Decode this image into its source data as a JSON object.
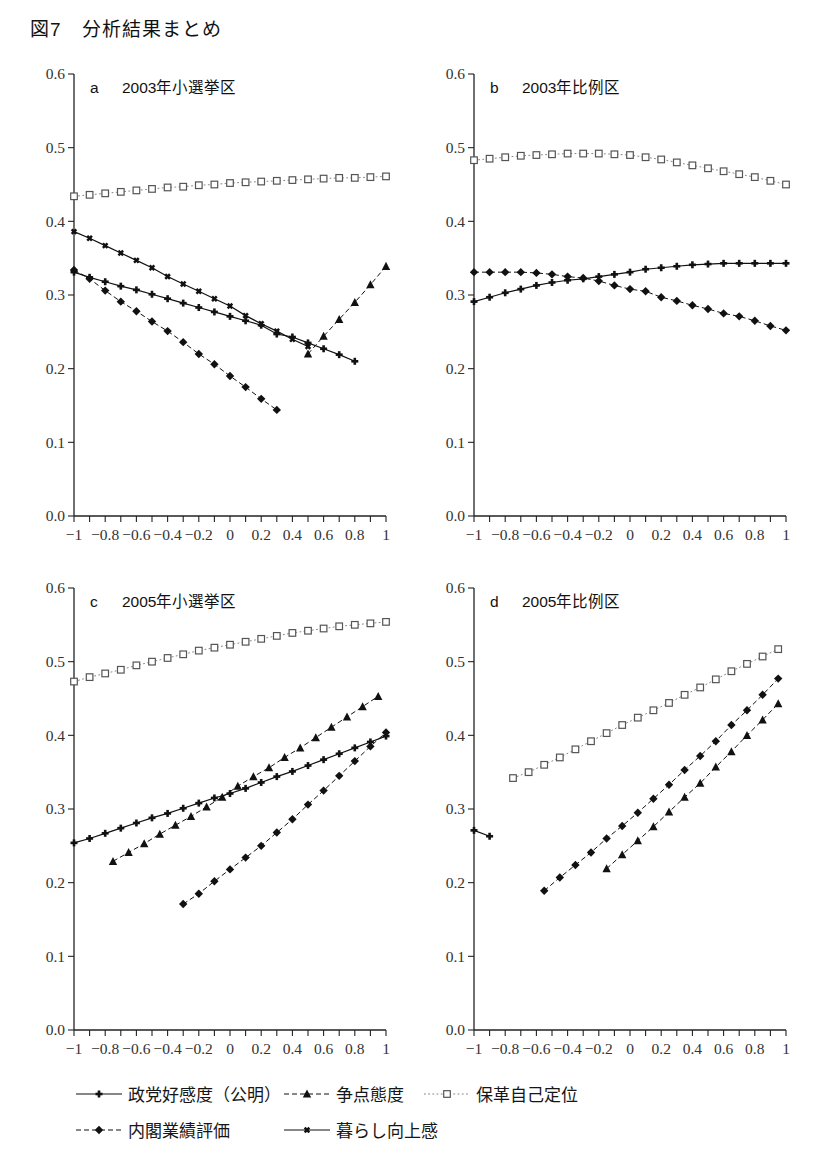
{
  "figure": {
    "title": "図7　分析結果まとめ",
    "label": "図7",
    "caption": "分析結果まとめ"
  },
  "axes": {
    "y_ticks": [
      "0.0",
      "0.1",
      "0.2",
      "0.3",
      "0.4",
      "0.5",
      "0.6"
    ],
    "x_ticks": [
      "−1",
      "−0.8",
      "−0.6",
      "−0.4",
      "−0.2",
      "0",
      "0.2",
      "0.4",
      "0.6",
      "0.8",
      "1"
    ],
    "ylim": [
      0.0,
      0.6
    ],
    "xlim": [
      -1.0,
      1.0
    ],
    "y_major_step": 0.1,
    "x_major_step": 0.2,
    "x_minor_step": 0.1,
    "grid": "off"
  },
  "legend": {
    "position": "bottom",
    "items": [
      {
        "label": "政党好感度（公明）",
        "marker": "plus",
        "line": "solid",
        "color": "#111111"
      },
      {
        "label": "争点態度",
        "marker": "triangle",
        "line": "dashed",
        "color": "#111111"
      },
      {
        "label": "保革自己定位",
        "marker": "square",
        "line": "dotted",
        "color": "#777777"
      },
      {
        "label": "内閣業績評価",
        "marker": "diamond",
        "line": "dashdot",
        "color": "#111111"
      },
      {
        "label": "暮らし向上感",
        "marker": "cross",
        "line": "solid",
        "color": "#111111"
      }
    ]
  },
  "chart_data": [
    {
      "type": "line",
      "panel": "a",
      "title": "2003年小選挙区",
      "xlabel": "",
      "ylabel": "",
      "xlim": [
        -1,
        1
      ],
      "ylim": [
        0,
        0.6
      ],
      "grid": "off",
      "series": [
        {
          "name": "保革自己定位",
          "marker": "square",
          "line": "dotted",
          "x": [
            -1,
            -0.9,
            -0.8,
            -0.7,
            -0.6,
            -0.5,
            -0.4,
            -0.3,
            -0.2,
            -0.1,
            0,
            0.1,
            0.2,
            0.3,
            0.4,
            0.5,
            0.6,
            0.7,
            0.8,
            0.9,
            1
          ],
          "values": [
            0.434,
            0.436,
            0.438,
            0.44,
            0.442,
            0.444,
            0.446,
            0.447,
            0.449,
            0.45,
            0.452,
            0.453,
            0.454,
            0.455,
            0.456,
            0.457,
            0.458,
            0.459,
            0.459,
            0.46,
            0.461
          ]
        },
        {
          "name": "暮らし向上感",
          "marker": "cross",
          "line": "solid",
          "x": [
            -1,
            -0.9,
            -0.8,
            -0.7,
            -0.6,
            -0.5,
            -0.4,
            -0.3,
            -0.2,
            -0.1,
            0,
            0.1,
            0.2,
            0.3,
            0.4,
            0.5
          ],
          "values": [
            0.386,
            0.377,
            0.367,
            0.357,
            0.347,
            0.337,
            0.325,
            0.315,
            0.305,
            0.295,
            0.285,
            0.272,
            0.261,
            0.251,
            0.24,
            0.23
          ]
        },
        {
          "name": "政党好感度（公明）",
          "marker": "plus",
          "line": "solid",
          "x": [
            -1,
            -0.9,
            -0.8,
            -0.7,
            -0.6,
            -0.5,
            -0.4,
            -0.3,
            -0.2,
            -0.1,
            0,
            0.1,
            0.2,
            0.3,
            0.4,
            0.5,
            0.6,
            0.7,
            0.8
          ],
          "values": [
            0.331,
            0.324,
            0.318,
            0.312,
            0.307,
            0.301,
            0.295,
            0.289,
            0.283,
            0.277,
            0.271,
            0.265,
            0.259,
            0.247,
            0.243,
            0.235,
            0.227,
            0.219,
            0.21
          ]
        },
        {
          "name": "内閣業績評価",
          "marker": "diamond",
          "line": "dashdot",
          "x": [
            -1,
            -0.9,
            -0.8,
            -0.7,
            -0.6,
            -0.5,
            -0.4,
            -0.3,
            -0.2,
            -0.1,
            0,
            0.1,
            0.2,
            0.3
          ],
          "values": [
            0.334,
            0.322,
            0.306,
            0.291,
            0.278,
            0.264,
            0.251,
            0.236,
            0.22,
            0.206,
            0.19,
            0.175,
            0.159,
            0.144
          ]
        },
        {
          "name": "争点態度",
          "marker": "triangle",
          "line": "dashed",
          "x": [
            0.5,
            0.6,
            0.7,
            0.8,
            0.9,
            1.0
          ],
          "values": [
            0.22,
            0.244,
            0.267,
            0.29,
            0.314,
            0.339
          ]
        }
      ]
    },
    {
      "type": "line",
      "panel": "b",
      "title": "2003年比例区",
      "xlabel": "",
      "ylabel": "",
      "xlim": [
        -1,
        1
      ],
      "ylim": [
        0,
        0.6
      ],
      "grid": "off",
      "series": [
        {
          "name": "保革自己定位",
          "marker": "square",
          "line": "dotted",
          "x": [
            -1,
            -0.9,
            -0.8,
            -0.7,
            -0.6,
            -0.5,
            -0.4,
            -0.3,
            -0.2,
            -0.1,
            0,
            0.1,
            0.2,
            0.3,
            0.4,
            0.5,
            0.6,
            0.7,
            0.8,
            0.9,
            1
          ],
          "values": [
            0.483,
            0.485,
            0.487,
            0.489,
            0.49,
            0.491,
            0.492,
            0.492,
            0.492,
            0.491,
            0.49,
            0.487,
            0.484,
            0.48,
            0.476,
            0.472,
            0.468,
            0.464,
            0.46,
            0.455,
            0.45
          ]
        },
        {
          "name": "政党好感度（公明）",
          "marker": "plus",
          "line": "solid",
          "x": [
            -1,
            -0.9,
            -0.8,
            -0.7,
            -0.6,
            -0.5,
            -0.4,
            -0.3,
            -0.2,
            -0.1,
            0,
            0.1,
            0.2,
            0.3,
            0.4,
            0.5,
            0.6,
            0.7,
            0.8,
            0.9,
            1
          ],
          "values": [
            0.291,
            0.297,
            0.303,
            0.308,
            0.313,
            0.317,
            0.32,
            0.322,
            0.325,
            0.328,
            0.331,
            0.335,
            0.337,
            0.339,
            0.341,
            0.342,
            0.343,
            0.343,
            0.343,
            0.343,
            0.343
          ]
        },
        {
          "name": "内閣業績評価",
          "marker": "diamond",
          "line": "dashdot",
          "x": [
            -1,
            -0.9,
            -0.8,
            -0.7,
            -0.6,
            -0.5,
            -0.4,
            -0.3,
            -0.2,
            -0.1,
            0,
            0.1,
            0.2,
            0.3,
            0.4,
            0.5,
            0.6,
            0.7,
            0.8,
            0.9,
            1
          ],
          "values": [
            0.331,
            0.331,
            0.331,
            0.331,
            0.33,
            0.328,
            0.325,
            0.323,
            0.319,
            0.313,
            0.308,
            0.305,
            0.297,
            0.292,
            0.286,
            0.281,
            0.275,
            0.271,
            0.265,
            0.258,
            0.252
          ]
        }
      ]
    },
    {
      "type": "line",
      "panel": "c",
      "title": "2005年小選挙区",
      "xlabel": "",
      "ylabel": "",
      "xlim": [
        -1,
        1
      ],
      "ylim": [
        0,
        0.6
      ],
      "grid": "off",
      "series": [
        {
          "name": "保革自己定位",
          "marker": "square",
          "line": "dotted",
          "x": [
            -1,
            -0.9,
            -0.8,
            -0.7,
            -0.6,
            -0.5,
            -0.4,
            -0.3,
            -0.2,
            -0.1,
            0,
            0.1,
            0.2,
            0.3,
            0.4,
            0.5,
            0.6,
            0.7,
            0.8,
            0.9,
            1
          ],
          "values": [
            0.473,
            0.479,
            0.484,
            0.489,
            0.495,
            0.5,
            0.505,
            0.51,
            0.515,
            0.519,
            0.523,
            0.527,
            0.531,
            0.535,
            0.539,
            0.542,
            0.545,
            0.548,
            0.55,
            0.552,
            0.554
          ]
        },
        {
          "name": "争点態度",
          "marker": "triangle",
          "line": "dashed",
          "x": [
            -0.75,
            -0.65,
            -0.55,
            -0.45,
            -0.35,
            -0.25,
            -0.15,
            -0.05,
            0.05,
            0.15,
            0.25,
            0.35,
            0.45,
            0.55,
            0.65,
            0.75,
            0.85,
            0.95
          ],
          "values": [
            0.229,
            0.241,
            0.253,
            0.266,
            0.278,
            0.29,
            0.303,
            0.316,
            0.331,
            0.344,
            0.356,
            0.37,
            0.383,
            0.397,
            0.411,
            0.425,
            0.439,
            0.453
          ]
        },
        {
          "name": "政党好感度（公明）",
          "marker": "plus",
          "line": "solid",
          "x": [
            -1,
            -0.9,
            -0.8,
            -0.7,
            -0.6,
            -0.5,
            -0.4,
            -0.3,
            -0.2,
            -0.1,
            0,
            0.1,
            0.2,
            0.3,
            0.4,
            0.5,
            0.6,
            0.7,
            0.8,
            0.9,
            1
          ],
          "values": [
            0.254,
            0.26,
            0.267,
            0.274,
            0.281,
            0.288,
            0.294,
            0.301,
            0.308,
            0.315,
            0.321,
            0.328,
            0.336,
            0.344,
            0.351,
            0.359,
            0.367,
            0.375,
            0.383,
            0.391,
            0.399
          ]
        },
        {
          "name": "内閣業績評価",
          "marker": "diamond",
          "line": "dashdot",
          "x": [
            -0.3,
            -0.2,
            -0.1,
            0,
            0.1,
            0.2,
            0.3,
            0.4,
            0.5,
            0.6,
            0.7,
            0.8,
            0.9,
            1
          ],
          "values": [
            0.171,
            0.185,
            0.202,
            0.218,
            0.234,
            0.25,
            0.268,
            0.286,
            0.306,
            0.325,
            0.345,
            0.365,
            0.385,
            0.404
          ]
        }
      ]
    },
    {
      "type": "line",
      "panel": "d",
      "title": "2005年比例区",
      "xlabel": "",
      "ylabel": "",
      "xlim": [
        -1,
        1
      ],
      "ylim": [
        0,
        0.6
      ],
      "grid": "off",
      "series": [
        {
          "name": "保革自己定位",
          "marker": "square",
          "line": "dotted",
          "x": [
            -0.75,
            -0.65,
            -0.55,
            -0.45,
            -0.35,
            -0.25,
            -0.15,
            -0.05,
            0.05,
            0.15,
            0.25,
            0.35,
            0.45,
            0.55,
            0.65,
            0.75,
            0.85,
            0.95
          ],
          "values": [
            0.342,
            0.35,
            0.36,
            0.37,
            0.381,
            0.392,
            0.403,
            0.414,
            0.424,
            0.434,
            0.444,
            0.455,
            0.465,
            0.476,
            0.487,
            0.497,
            0.507,
            0.517
          ]
        },
        {
          "name": "内閣業績評価",
          "marker": "diamond",
          "line": "dashdot",
          "x": [
            -0.55,
            -0.45,
            -0.35,
            -0.25,
            -0.15,
            -0.05,
            0.05,
            0.15,
            0.25,
            0.35,
            0.45,
            0.55,
            0.65,
            0.75,
            0.85,
            0.95
          ],
          "values": [
            0.189,
            0.207,
            0.224,
            0.241,
            0.26,
            0.277,
            0.295,
            0.314,
            0.333,
            0.353,
            0.372,
            0.392,
            0.414,
            0.434,
            0.455,
            0.477
          ]
        },
        {
          "name": "争点態度",
          "marker": "triangle",
          "line": "dashed",
          "x": [
            -0.15,
            -0.05,
            0.05,
            0.15,
            0.25,
            0.35,
            0.45,
            0.55,
            0.65,
            0.75,
            0.85,
            0.95
          ],
          "values": [
            0.219,
            0.238,
            0.257,
            0.276,
            0.296,
            0.316,
            0.335,
            0.357,
            0.378,
            0.4,
            0.421,
            0.443
          ]
        },
        {
          "name": "政党好感度（公明）",
          "marker": "plus",
          "line": "solid",
          "x": [
            -1,
            -0.9
          ],
          "values": [
            0.271,
            0.263
          ]
        }
      ]
    }
  ]
}
